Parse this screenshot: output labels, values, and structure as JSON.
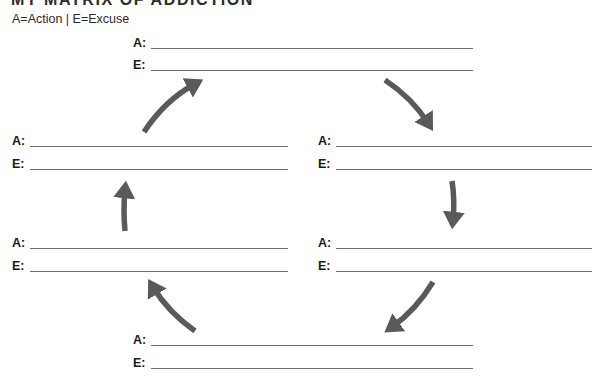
{
  "header": {
    "title": "MY MATRIX OF ADDICTION",
    "subtitle": "A=Action | E=Excuse"
  },
  "labels": {
    "action": "A:",
    "excuse": "E:"
  },
  "pairs": [
    {
      "position": "top",
      "action_value": "",
      "excuse_value": ""
    },
    {
      "position": "left-upper",
      "action_value": "",
      "excuse_value": ""
    },
    {
      "position": "right-upper",
      "action_value": "",
      "excuse_value": ""
    },
    {
      "position": "left-lower",
      "action_value": "",
      "excuse_value": ""
    },
    {
      "position": "right-lower",
      "action_value": "",
      "excuse_value": ""
    },
    {
      "position": "bottom",
      "action_value": "",
      "excuse_value": ""
    }
  ],
  "arrows": {
    "color": "#5a5a5a",
    "direction": "clockwise",
    "items": [
      "top-left-up-right",
      "top-right-down-right",
      "right-down",
      "bottom-right-down-left",
      "bottom-left-up-left",
      "left-up"
    ]
  }
}
